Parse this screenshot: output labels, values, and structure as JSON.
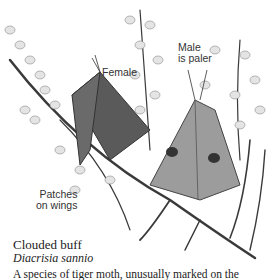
{
  "labels": {
    "female": "Female",
    "male_line1": "Male",
    "male_line2": "is paler",
    "patches_line1": "Patches",
    "patches_line2": "on wings"
  },
  "caption": {
    "common_name": "Clouded buff",
    "latin_name": "Diacrisia sannio",
    "description": "A species of tiger moth, unusually marked on the"
  }
}
